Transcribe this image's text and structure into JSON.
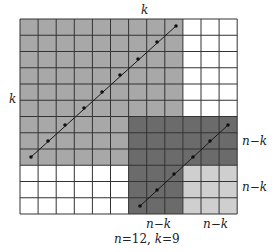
{
  "diagram": {
    "n": 12,
    "k": 9,
    "grid": {
      "left": 20,
      "top": 19,
      "cell_w": 18.1,
      "cell_h": 16.25,
      "line_color": "#333333",
      "colors": {
        "white": "#ffffff",
        "medium": "#a8a8a8",
        "dark": "#6b6b6b",
        "light": "#cfcfcf"
      }
    },
    "regions": [
      {
        "name": "k-by-k-square",
        "color": "medium",
        "col": 0,
        "row": 0,
        "cols": 9,
        "rows": 9
      },
      {
        "name": "dark-strip-vertical",
        "color": "dark",
        "col": 6,
        "row": 6,
        "cols": 3,
        "rows": 6
      },
      {
        "name": "dark-strip-horizontal",
        "color": "dark",
        "col": 9,
        "row": 6,
        "cols": 3,
        "rows": 3
      },
      {
        "name": "light-corner",
        "color": "light",
        "col": 9,
        "row": 9,
        "cols": 3,
        "rows": 3
      }
    ],
    "diagonals": [
      {
        "name": "long-diagonal",
        "x1": 31,
        "y1": 157,
        "x2": 176,
        "y2": 26,
        "dots": [
          [
            31,
            157
          ],
          [
            48,
            141
          ],
          [
            65,
            125
          ],
          [
            84,
            108
          ],
          [
            102,
            92
          ],
          [
            120,
            75
          ],
          [
            138,
            59
          ],
          [
            157,
            42
          ],
          [
            176,
            26
          ]
        ]
      },
      {
        "name": "short-diagonal",
        "x1": 140,
        "y1": 206,
        "x2": 228,
        "y2": 125,
        "dots": [
          [
            140,
            206
          ],
          [
            157,
            190
          ],
          [
            174,
            174
          ],
          [
            193,
            157
          ],
          [
            210,
            141
          ],
          [
            228,
            125
          ]
        ]
      }
    ],
    "labels": {
      "top_k": "k",
      "left_k": "k",
      "right_upper": "n−k",
      "right_lower": "n−k",
      "bottom_left": "n−k",
      "bottom_right": "n−k",
      "caption": "n=12, k=9"
    }
  }
}
